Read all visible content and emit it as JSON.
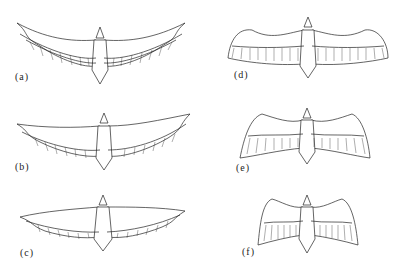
{
  "figure": {
    "ink_color": "#222222",
    "background": "#ffffff",
    "panels": [
      {
        "id": "a",
        "label": "(a)",
        "column": "left",
        "row": 1,
        "wing_shape": "fully extended, slightly swept tips"
      },
      {
        "id": "b",
        "label": "(b)",
        "column": "left",
        "row": 2,
        "wing_shape": "extended, tips swept back"
      },
      {
        "id": "c",
        "label": "(c)",
        "column": "left",
        "row": 3,
        "wing_shape": "extended, narrow tips swept back"
      },
      {
        "id": "d",
        "label": "(d)",
        "column": "right",
        "row": 1,
        "wing_shape": "broad, rounded, tips drooped"
      },
      {
        "id": "e",
        "label": "(e)",
        "column": "right",
        "row": 2,
        "wing_shape": "flexed, wings arched downward"
      },
      {
        "id": "f",
        "label": "(f)",
        "column": "right",
        "row": 3,
        "wing_shape": "strongly flexed, short span"
      }
    ]
  }
}
